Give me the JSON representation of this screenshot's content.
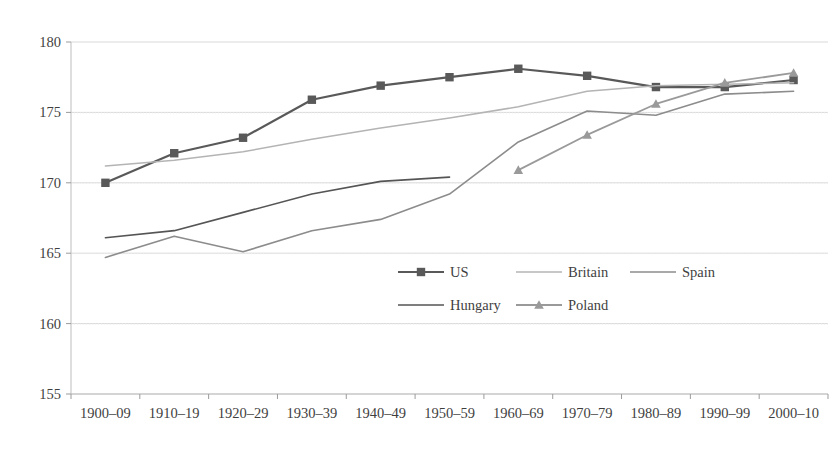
{
  "chart_data": {
    "type": "line",
    "title": "",
    "subtitle": "",
    "xlabel": "",
    "ylabel": "",
    "categories": [
      "1900–09",
      "1910–19",
      "1920–29",
      "1930–39",
      "1940–49",
      "1950–59",
      "1960–69",
      "1970–79",
      "1980–89",
      "1990–99",
      "2000–10"
    ],
    "ylim": [
      155,
      180
    ],
    "yticks": [
      155,
      160,
      165,
      170,
      175,
      180
    ],
    "ytick_labels": [
      "155",
      "160",
      "165",
      "170",
      "175",
      "180"
    ],
    "grid": true,
    "legend_position": "inside-bottom-center",
    "series": [
      {
        "name": "US",
        "color": "#595959",
        "marker": "square",
        "width": 2.2,
        "values": [
          170.0,
          172.1,
          173.2,
          175.9,
          176.9,
          177.5,
          178.1,
          177.6,
          176.8,
          176.8,
          177.3
        ]
      },
      {
        "name": "Britain",
        "color": "#b4b4b4",
        "marker": "none",
        "width": 1.5,
        "values": [
          171.2,
          171.6,
          172.2,
          173.1,
          173.9,
          174.6,
          175.4,
          176.5,
          176.9,
          177.0,
          177.1
        ]
      },
      {
        "name": "Spain",
        "color": "#8c8c8c",
        "marker": "none",
        "width": 1.6,
        "values": [
          164.7,
          166.2,
          165.1,
          166.6,
          167.4,
          169.2,
          172.9,
          175.1,
          174.8,
          176.3,
          176.5
        ]
      },
      {
        "name": "Hungary",
        "color": "#555555",
        "marker": "none",
        "width": 1.6,
        "values": [
          166.1,
          166.6,
          167.9,
          169.2,
          170.1,
          170.4,
          null,
          null,
          null,
          null,
          null
        ]
      },
      {
        "name": "Poland",
        "color": "#9a9a9a",
        "marker": "triangle",
        "width": 1.8,
        "values": [
          null,
          null,
          null,
          null,
          null,
          null,
          170.9,
          173.4,
          175.6,
          177.1,
          177.8
        ]
      }
    ]
  },
  "legend": {
    "rows": [
      [
        "US",
        "Britain",
        "Spain"
      ],
      [
        "Hungary",
        "Poland"
      ]
    ]
  },
  "axes": {
    "y_min_label": "155",
    "y_max_label": "180"
  }
}
